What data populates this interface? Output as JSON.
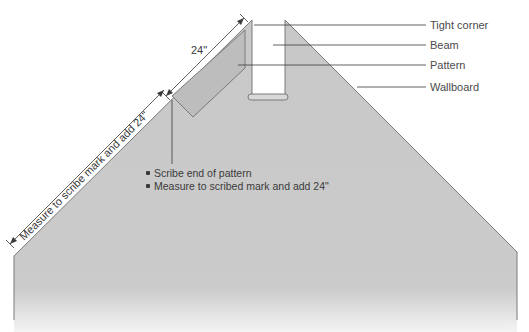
{
  "diagram": {
    "callouts": [
      {
        "label": "Tight corner"
      },
      {
        "label": "Beam"
      },
      {
        "label": "Pattern"
      },
      {
        "label": "Wallboard"
      }
    ],
    "dimensions": {
      "top": "24\"",
      "long": "Measure to scribe mark and add 24\""
    },
    "notes": [
      "Scribe end of pattern",
      "Measure to scribed mark and add 24\""
    ],
    "colors": {
      "wallboard": "#c9c9c9",
      "outline": "#6a6a6a",
      "line": "#3a3a3a",
      "beam_gap": "#ffffff"
    }
  }
}
